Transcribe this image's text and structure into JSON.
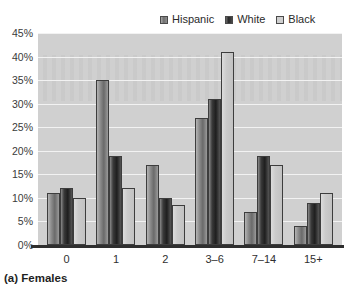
{
  "caption": "(a) Females",
  "legend": {
    "position": "top",
    "items": [
      {
        "label": "Hispanic",
        "icon": "legend-swatch-icon",
        "color": "#7a7a7a"
      },
      {
        "label": "White",
        "icon": "legend-swatch-icon",
        "color": "#2b2b2b"
      },
      {
        "label": "Black",
        "icon": "legend-swatch-icon",
        "color": "#cccccc"
      }
    ]
  },
  "chart_data": {
    "type": "bar",
    "title": "(a) Females",
    "xlabel": "",
    "ylabel": "",
    "ylim": [
      0,
      45
    ],
    "grid": true,
    "categories": [
      "0",
      "1",
      "2",
      "3–6",
      "7–14",
      "15+"
    ],
    "ytick_labels": [
      "0%",
      "5%",
      "10%",
      "15%",
      "20%",
      "25%",
      "30%",
      "35%",
      "40%",
      "45%"
    ],
    "ytick_values": [
      0,
      5,
      10,
      15,
      20,
      25,
      30,
      35,
      40,
      45
    ],
    "series": [
      {
        "name": "Hispanic",
        "color": "#7a7a7a",
        "values": [
          11,
          35,
          17,
          27,
          7,
          4
        ]
      },
      {
        "name": "White",
        "color": "#2b2b2b",
        "values": [
          12,
          19,
          10,
          31,
          19,
          9
        ]
      },
      {
        "name": "Black",
        "color": "#cccccc",
        "values": [
          10,
          12,
          8.5,
          41,
          17,
          11
        ]
      }
    ]
  }
}
